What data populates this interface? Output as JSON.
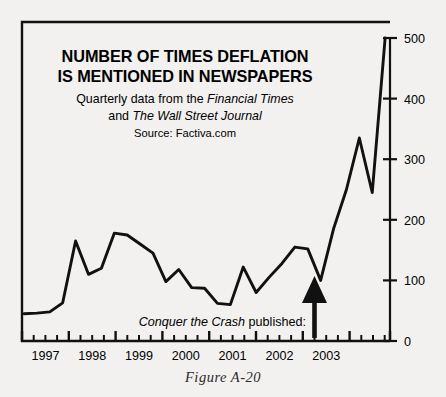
{
  "figure": {
    "caption": "Figure A-20"
  },
  "chart_data": {
    "type": "line",
    "title_line1": "NUMBER OF TIMES DEFLATION",
    "title_line2": "IS MENTIONED IN NEWSPAPERS",
    "subtitle_line1_prefix": "Quarterly data from the ",
    "subtitle_line1_italic": "Financial Times",
    "subtitle_line2_prefix": "and ",
    "subtitle_line2_italic": "The Wall Street Journal",
    "source": "Source: Factiva.com",
    "xlabel": "",
    "ylabel": "",
    "ylim": [
      0,
      500
    ],
    "yticks": [
      0,
      100,
      200,
      300,
      400,
      500
    ],
    "ytick_labels": [
      "0",
      "100",
      "200",
      "300",
      "400",
      "500"
    ],
    "y_axis_position": "right",
    "grid": false,
    "legend": false,
    "x_tick_labels": [
      "1997",
      "1998",
      "1999",
      "2000",
      "2001",
      "2002",
      "2003"
    ],
    "x_minor_ticks_per_year": 4,
    "x_period": "quarterly",
    "x": [
      "1996Q4",
      "1997Q1",
      "1997Q2",
      "1997Q3",
      "1997Q4",
      "1998Q1",
      "1998Q2",
      "1998Q3",
      "1998Q4",
      "1999Q1",
      "1999Q2",
      "1999Q3",
      "1999Q4",
      "2000Q1",
      "2000Q2",
      "2000Q3",
      "2000Q4",
      "2001Q1",
      "2001Q2",
      "2001Q3",
      "2001Q4",
      "2002Q1",
      "2002Q2",
      "2002Q3",
      "2002Q4"
    ],
    "values": [
      45,
      46,
      48,
      63,
      165,
      110,
      120,
      178,
      175,
      160,
      145,
      98,
      118,
      88,
      87,
      62,
      60,
      122,
      80,
      105,
      128,
      155,
      152,
      100,
      185
    ],
    "series": [
      {
        "name": "Mentions of deflation",
        "points": [
          {
            "x": "1996Q4",
            "y": 45
          },
          {
            "x": "1997Q1",
            "y": 46
          },
          {
            "x": "1997Q2",
            "y": 48
          },
          {
            "x": "1997Q3",
            "y": 63
          },
          {
            "x": "1997Q4",
            "y": 165
          },
          {
            "x": "1998Q1",
            "y": 110
          },
          {
            "x": "1998Q2",
            "y": 120
          },
          {
            "x": "1998Q3",
            "y": 178
          },
          {
            "x": "1998Q4",
            "y": 175
          },
          {
            "x": "1999Q1",
            "y": 160
          },
          {
            "x": "1999Q2",
            "y": 145
          },
          {
            "x": "1999Q3",
            "y": 98
          },
          {
            "x": "1999Q4",
            "y": 118
          },
          {
            "x": "2000Q1",
            "y": 88
          },
          {
            "x": "2000Q2",
            "y": 87
          },
          {
            "x": "2000Q3",
            "y": 62
          },
          {
            "x": "2000Q4",
            "y": 60
          },
          {
            "x": "2001Q1",
            "y": 122
          },
          {
            "x": "2001Q2",
            "y": 80
          },
          {
            "x": "2001Q3",
            "y": 105
          },
          {
            "x": "2001Q4",
            "y": 128
          },
          {
            "x": "2002Q1",
            "y": 155
          },
          {
            "x": "2002Q2",
            "y": 152
          },
          {
            "x": "2002Q3",
            "y": 100
          },
          {
            "x": "2002Q4",
            "y": 185
          }
        ]
      }
    ],
    "tail_points": [
      {
        "x": "2002Q4b",
        "y": 250
      },
      {
        "x": "2003Q1",
        "y": 335
      },
      {
        "x": "2003Q1b",
        "y": 245
      },
      {
        "x": "2003Q2",
        "y": 500
      }
    ],
    "annotation": {
      "text_italic": "Conquer the Crash",
      "text_regular": " published:",
      "marker": "up-arrow",
      "points_to_x": "2002Q1",
      "points_to_y": 100
    }
  },
  "colors": {
    "background": "#f2f1ef",
    "line": "#111111",
    "axis": "#111111",
    "text": "#1a1a1a"
  }
}
